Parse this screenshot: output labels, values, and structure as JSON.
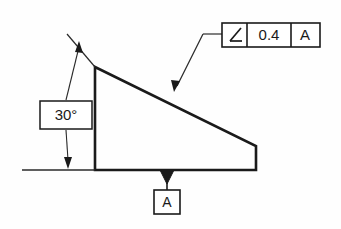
{
  "drawing": {
    "title": "Angularity geometric tolerance callout on wedge part",
    "background_color": "#fefefe",
    "line_color": "#1a1a1a",
    "thin_line_color": "#3a3a3a"
  },
  "feature_control_frame": {
    "symbol_name": "angularity-symbol",
    "symbol_glyph": "∠",
    "tolerance_value": "0.4",
    "datum_reference": "A"
  },
  "angle_dimension": {
    "value": "30°",
    "label_name": "angle-dimension-value"
  },
  "datum_feature": {
    "letter": "A",
    "symbol_name": "datum-triangle-filled"
  },
  "part_outline": {
    "name": "wedge-profile",
    "vertices": "95,67 256,146 256,170 95,170",
    "description": "Right trapezoid wedge with inclined upper surface"
  },
  "leaders": {
    "fcf_leader_name": "angularity-leader-line",
    "angle_upper_leader_name": "angle-upper-extension-leader",
    "angle_lower_leader_name": "angle-lower-extension-leader",
    "datum_baseline_name": "horizontal-datum-baseline",
    "slope_extension_name": "inclined-surface-extension-line"
  }
}
